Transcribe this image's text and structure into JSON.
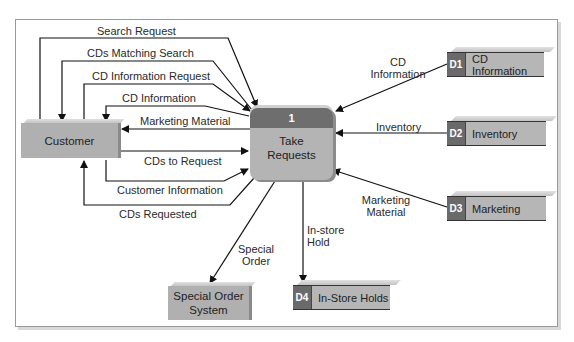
{
  "diagram": {
    "type": "data flow diagram",
    "process": {
      "number": "1",
      "name_line1": "Take",
      "name_line2": "Requests"
    },
    "entities": {
      "customer": "Customer",
      "special_order_line1": "Special Order",
      "special_order_line2": "System"
    },
    "stores": [
      {
        "id": "D1",
        "name": "CD Information"
      },
      {
        "id": "D2",
        "name": "Inventory"
      },
      {
        "id": "D3",
        "name": "Marketing"
      },
      {
        "id": "D4",
        "name": "In-Store Holds"
      }
    ],
    "flows": {
      "search_request": "Search Request",
      "cds_matching_search": "CDs Matching Search",
      "cd_information_request": "CD Information Request",
      "cd_information_to_customer": "CD Information",
      "marketing_material_to_customer": "Marketing Material",
      "cds_to_request": "CDs to Request",
      "customer_information": "Customer Information",
      "cds_requested": "CDs Requested",
      "cd_information_store_line1": "CD",
      "cd_information_store_line2": "Information",
      "inventory": "Inventory",
      "marketing_material_store_line1": "Marketing",
      "marketing_material_store_line2": "Material",
      "special_order_line1": "Special",
      "special_order_line2": "Order",
      "instore_hold_line1": "In-store",
      "instore_hold_line2": "Hold"
    }
  }
}
